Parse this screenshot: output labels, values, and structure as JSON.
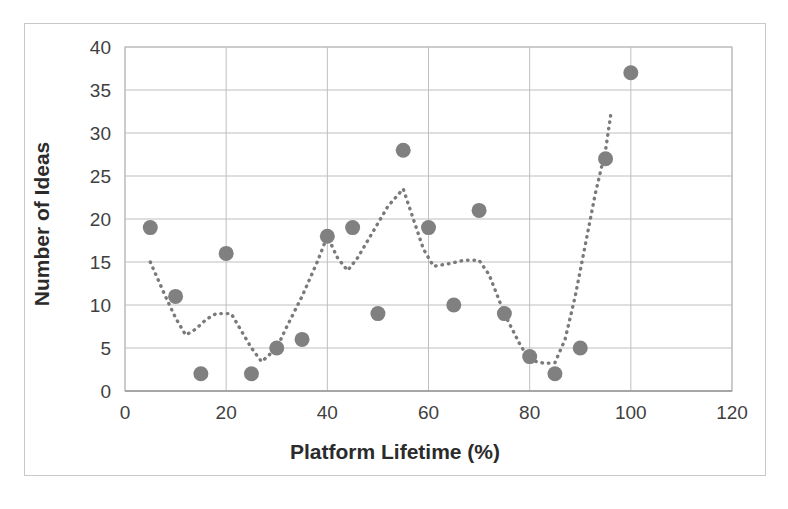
{
  "chart_data": {
    "type": "scatter",
    "title": "",
    "xlabel": "Platform Lifetime (%)",
    "ylabel": "Number of Ideas",
    "xlim": [
      0,
      120
    ],
    "ylim": [
      0,
      40
    ],
    "xticks": [
      0,
      20,
      40,
      60,
      80,
      100,
      120
    ],
    "yticks": [
      0,
      5,
      10,
      15,
      20,
      25,
      30,
      35,
      40
    ],
    "grid": "horizontal-and-vertical",
    "legend": "none",
    "marker_color": "#808080",
    "trendline_color": "#7a7a7a",
    "grid_color": "#bfbfbf",
    "series": [
      {
        "name": "Ideas per platform lifetime",
        "type": "scatter",
        "points": [
          {
            "x": 5,
            "y": 19
          },
          {
            "x": 10,
            "y": 11
          },
          {
            "x": 15,
            "y": 2
          },
          {
            "x": 20,
            "y": 16
          },
          {
            "x": 25,
            "y": 2
          },
          {
            "x": 30,
            "y": 5
          },
          {
            "x": 35,
            "y": 6
          },
          {
            "x": 40,
            "y": 18
          },
          {
            "x": 45,
            "y": 19
          },
          {
            "x": 50,
            "y": 9
          },
          {
            "x": 55,
            "y": 28
          },
          {
            "x": 60,
            "y": 19
          },
          {
            "x": 65,
            "y": 10
          },
          {
            "x": 70,
            "y": 21
          },
          {
            "x": 75,
            "y": 9
          },
          {
            "x": 80,
            "y": 4
          },
          {
            "x": 85,
            "y": 2
          },
          {
            "x": 90,
            "y": 5
          },
          {
            "x": 95,
            "y": 27
          },
          {
            "x": 100,
            "y": 37
          }
        ]
      },
      {
        "name": "Moving average trend",
        "type": "line",
        "style": "dotted",
        "points": [
          {
            "x": 5,
            "y": 15.0
          },
          {
            "x": 8,
            "y": 11.0
          },
          {
            "x": 10,
            "y": 8.5
          },
          {
            "x": 12,
            "y": 6.5
          },
          {
            "x": 14,
            "y": 7.2
          },
          {
            "x": 16,
            "y": 8.3
          },
          {
            "x": 18,
            "y": 9.0
          },
          {
            "x": 21,
            "y": 9.0
          },
          {
            "x": 23,
            "y": 7.0
          },
          {
            "x": 25,
            "y": 5.0
          },
          {
            "x": 27,
            "y": 3.4
          },
          {
            "x": 30,
            "y": 5.0
          },
          {
            "x": 32,
            "y": 7.5
          },
          {
            "x": 35,
            "y": 11.0
          },
          {
            "x": 38,
            "y": 15.0
          },
          {
            "x": 40,
            "y": 18.0
          },
          {
            "x": 42,
            "y": 15.5
          },
          {
            "x": 44,
            "y": 14.0
          },
          {
            "x": 46,
            "y": 15.5
          },
          {
            "x": 49,
            "y": 18.5
          },
          {
            "x": 52,
            "y": 21.5
          },
          {
            "x": 55,
            "y": 23.5
          },
          {
            "x": 57,
            "y": 20.0
          },
          {
            "x": 59,
            "y": 16.5
          },
          {
            "x": 61,
            "y": 14.5
          },
          {
            "x": 64,
            "y": 14.8
          },
          {
            "x": 67,
            "y": 15.2
          },
          {
            "x": 70,
            "y": 15.2
          },
          {
            "x": 72,
            "y": 13.5
          },
          {
            "x": 75,
            "y": 9.0
          },
          {
            "x": 78,
            "y": 5.5
          },
          {
            "x": 80,
            "y": 3.6
          },
          {
            "x": 83,
            "y": 3.2
          },
          {
            "x": 85,
            "y": 3.3
          },
          {
            "x": 87,
            "y": 6.0
          },
          {
            "x": 89,
            "y": 11.0
          },
          {
            "x": 91,
            "y": 17.0
          },
          {
            "x": 93,
            "y": 23.0
          },
          {
            "x": 95,
            "y": 28.0
          },
          {
            "x": 96,
            "y": 32.0
          }
        ]
      }
    ]
  }
}
